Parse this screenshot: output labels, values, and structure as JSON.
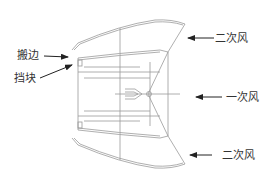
{
  "diagram": {
    "type": "burner-nozzle-cross-section",
    "line_color": "#9a9a9a",
    "arrow_color": "#222222",
    "labels": {
      "flange": "搬边",
      "block": "挡块",
      "secondary_air_top": "二次风",
      "primary_air": "一次风",
      "secondary_air_bottom": "二次风"
    }
  }
}
